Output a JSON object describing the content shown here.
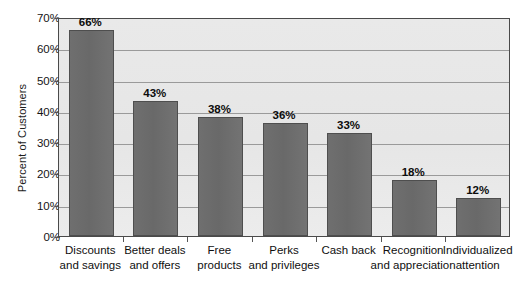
{
  "chart_data": {
    "type": "bar",
    "title": "",
    "subtitle": "",
    "xlabel": "",
    "ylabel": "Percent of Customers",
    "ylim": [
      0,
      70
    ],
    "ytick_values": [
      0,
      10,
      20,
      30,
      40,
      50,
      60,
      70
    ],
    "ytick_labels": [
      "0%",
      "10%",
      "20%",
      "30%",
      "40%",
      "50%",
      "60%",
      "70%"
    ],
    "grid": true,
    "legend": false,
    "legend_position": "none",
    "orientation": "vertical",
    "categories": [
      "Discounts and savings",
      "Better deals and offers",
      "Free products",
      "Perks and privileges",
      "Cash back",
      "Recognition and appreciation",
      "Individualized attention"
    ],
    "category_lines": [
      [
        "Discounts",
        "and savings"
      ],
      [
        "Better deals",
        "and offers"
      ],
      [
        "Free",
        "products"
      ],
      [
        "Perks",
        "and privileges"
      ],
      [
        "Cash back",
        ""
      ],
      [
        "Recognition",
        "and appreciation"
      ],
      [
        "Individualized",
        "attention"
      ]
    ],
    "values": [
      66,
      43,
      38,
      36,
      33,
      18,
      12
    ],
    "data_labels": [
      "66%",
      "43%",
      "38%",
      "36%",
      "33%",
      "18%",
      "12%"
    ],
    "colors": {
      "bar_fill": "#6d6d6d",
      "bar_border": "#4e4e4e",
      "plot_background": "#e8e8e8",
      "gridline": "#9a9a9a",
      "axis": "#4a4a4a",
      "text": "#0f0f0f",
      "figure_background": "#ffffff"
    }
  }
}
